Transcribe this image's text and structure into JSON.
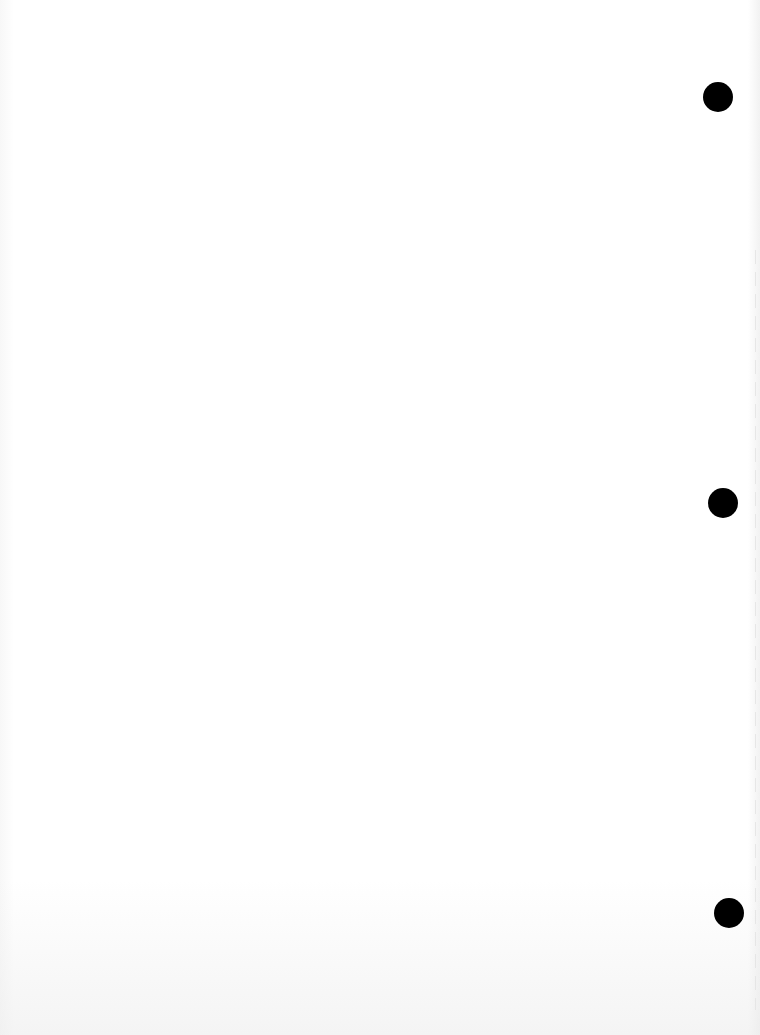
{
  "page": {
    "type": "blank scanned sheet",
    "background_color": "#ffffff",
    "text_content": ""
  },
  "hole_punches": [
    {
      "position": "top",
      "center_x": 718,
      "center_y": 97,
      "diameter": 30,
      "color": "#000000"
    },
    {
      "position": "middle",
      "center_x": 723,
      "center_y": 503,
      "diameter": 30,
      "color": "#000000"
    },
    {
      "position": "bottom",
      "center_x": 729,
      "center_y": 913,
      "diameter": 30,
      "color": "#000000"
    }
  ]
}
